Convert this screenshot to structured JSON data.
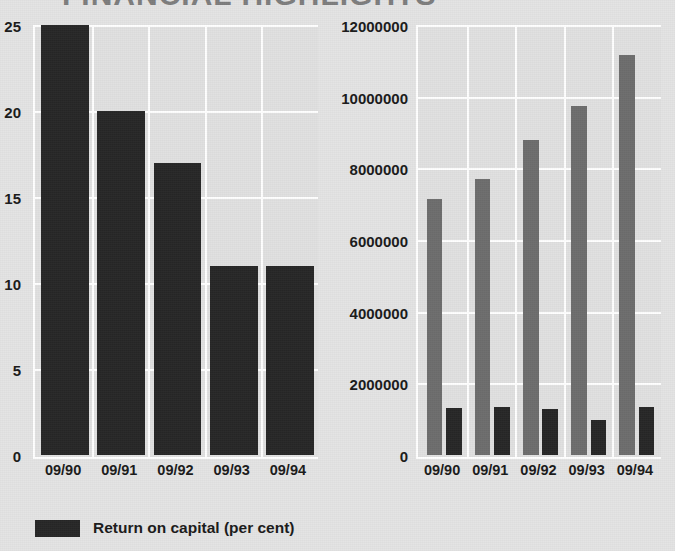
{
  "title_fragment": "FINANCIAL HIGHLIGHTS",
  "colors": {
    "background": "#e4e4e4",
    "plot_background": "#e1e1e1",
    "gridline": "#ffffff",
    "dark_bar": "#272727",
    "grey_bar": "#6d6d6d",
    "text": "#1a1a1a"
  },
  "chart_data": [
    {
      "id": "return-on-capital",
      "type": "bar",
      "title": "",
      "xlabel": "",
      "ylabel": "",
      "categories": [
        "09/90",
        "09/91",
        "09/92",
        "09/93",
        "09/94"
      ],
      "yticks": [
        0,
        5,
        10,
        15,
        20,
        25
      ],
      "yticklabels": [
        "0",
        "5",
        "10",
        "15",
        "20",
        "25"
      ],
      "ylim": [
        0,
        25
      ],
      "grid": true,
      "legend_position": "below",
      "series": [
        {
          "name": "Return on capital (per cent)",
          "color": "#272727",
          "values": [
            25,
            20,
            17,
            11,
            11
          ]
        }
      ]
    },
    {
      "id": "sales-and-profit",
      "type": "bar",
      "title": "",
      "xlabel": "",
      "ylabel": "",
      "categories": [
        "09/90",
        "09/91",
        "09/92",
        "09/93",
        "09/94"
      ],
      "yticks": [
        0,
        2000000,
        4000000,
        6000000,
        8000000,
        10000000,
        12000000
      ],
      "yticklabels": [
        "0",
        "2000000",
        "4000000",
        "6000000",
        "8000000",
        "10000000",
        "12000000"
      ],
      "ylim": [
        0,
        12000000
      ],
      "grid": true,
      "legend_position": "below",
      "series": [
        {
          "name": "Sales revenue",
          "color": "#6d6d6d",
          "values": [
            7150000,
            7700000,
            8800000,
            9750000,
            11150000
          ]
        },
        {
          "name": "Profit before tax  (£000s)",
          "color": "#272727",
          "values": [
            1300000,
            1330000,
            1280000,
            980000,
            1330000
          ]
        }
      ]
    }
  ],
  "legends": {
    "left": [
      {
        "label": "Return on capital (per cent)",
        "swatch": "dark"
      }
    ],
    "right": [
      {
        "label": "Sales revenue",
        "swatch": "grey"
      },
      {
        "label": "Profit before tax  (£000s)",
        "swatch": "dark"
      }
    ]
  }
}
